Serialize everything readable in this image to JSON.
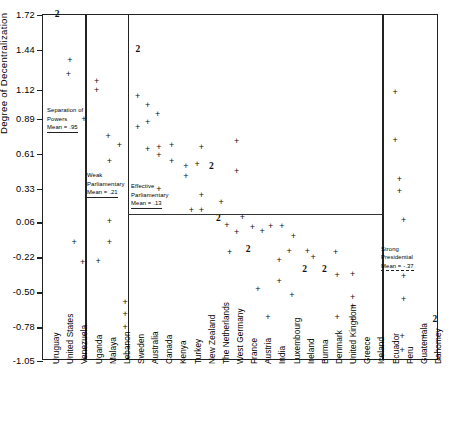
{
  "chart_data": {
    "type": "scatter",
    "title": "",
    "xlabel": "",
    "ylabel": "Degree of Decentralization",
    "ylim": [
      -1.05,
      1.72
    ],
    "grid": false,
    "legend": "none",
    "yticks": [
      "1.72",
      "1.44",
      "1.12",
      "0.89",
      "0.61",
      "0.33",
      "0.06",
      "-0.22",
      "-0.50",
      "-0.78",
      "-1.05"
    ],
    "ytick_values": [
      1.72,
      1.44,
      1.12,
      0.89,
      0.61,
      0.33,
      0.06,
      -0.22,
      -0.5,
      -0.78,
      -1.05
    ],
    "categories": [
      "Uruguay",
      "United States",
      "Venezuela",
      "Uganda",
      "Malaya",
      "Lebanon",
      "Sweden",
      "Australia",
      "Canada",
      "Kenya",
      "Turkey",
      "New Zealand",
      "The Netherlands",
      "West Germany",
      "France",
      "Austria",
      "India",
      "Luxembourg",
      "Ireland",
      "Burma",
      "Denmark",
      "United Kingdom",
      "Greece",
      "Iceland",
      "Ecuador",
      "Peru",
      "Guatemala",
      "Dahomey"
    ],
    "groups": [
      {
        "name": "Separation of Powers",
        "mean_label": "Mean = .95",
        "mean": 0.95,
        "categories": [
          "Uruguay",
          "United States",
          "Venezuela"
        ]
      },
      {
        "name": "Weak Parliamentary",
        "mean_label": "Mean = .21",
        "mean": 0.21,
        "categories": [
          "Uganda",
          "Malaya",
          "Lebanon"
        ]
      },
      {
        "name": "Effective Parliamentary",
        "mean_label": "Mean = .13",
        "mean": 0.13,
        "categories": [
          "Sweden",
          "Australia",
          "Canada",
          "Kenya",
          "Turkey",
          "New Zealand",
          "The Netherlands",
          "West Germany",
          "France",
          "Austria",
          "India",
          "Luxembourg",
          "Ireland",
          "Burma",
          "Denmark",
          "United Kingdom",
          "Greece",
          "Iceland"
        ]
      },
      {
        "name": "Strong Presidential",
        "mean_label": "Mean = -.37",
        "mean": -0.37,
        "categories": [
          "Ecuador",
          "Peru",
          "Guatemala",
          "Dahomey"
        ]
      }
    ],
    "points": [
      {
        "cx": 0.5,
        "y": 1.72,
        "marker": "2"
      },
      {
        "cx": 1.4,
        "y": 1.36,
        "marker": "+"
      },
      {
        "cx": 1.3,
        "y": 1.25,
        "marker": "+"
      },
      {
        "cx": 2.4,
        "y": 0.89,
        "marker": "+"
      },
      {
        "cx": 1.7,
        "y": -0.1,
        "marker": "+"
      },
      {
        "cx": 2.3,
        "y": -0.26,
        "marker": "+"
      },
      {
        "cx": 3.3,
        "y": 1.19,
        "marker": "+"
      },
      {
        "cx": 3.3,
        "y": 1.12,
        "marker": "+"
      },
      {
        "cx": 4.1,
        "y": 0.75,
        "marker": "+"
      },
      {
        "cx": 4.9,
        "y": 0.68,
        "marker": "+"
      },
      {
        "cx": 4.2,
        "y": 0.55,
        "marker": "+"
      },
      {
        "cx": 4.2,
        "y": 0.07,
        "marker": "+"
      },
      {
        "cx": 4.2,
        "y": -0.1,
        "marker": "+"
      },
      {
        "cx": 3.4,
        "y": -0.25,
        "marker": "+"
      },
      {
        "cx": 5.3,
        "y": -0.58,
        "marker": "+"
      },
      {
        "cx": 5.3,
        "y": -0.67,
        "marker": "+"
      },
      {
        "cx": 5.3,
        "y": -0.78,
        "marker": "+"
      },
      {
        "cx": 6.2,
        "y": 1.44,
        "marker": "2"
      },
      {
        "cx": 6.2,
        "y": 1.07,
        "marker": "+"
      },
      {
        "cx": 6.9,
        "y": 1.0,
        "marker": "+"
      },
      {
        "cx": 7.6,
        "y": 0.93,
        "marker": "+"
      },
      {
        "cx": 6.9,
        "y": 0.86,
        "marker": "+"
      },
      {
        "cx": 6.2,
        "y": 0.82,
        "marker": "+"
      },
      {
        "cx": 6.9,
        "y": 0.65,
        "marker": "+"
      },
      {
        "cx": 7.7,
        "y": 0.66,
        "marker": "+"
      },
      {
        "cx": 8.6,
        "y": 0.68,
        "marker": "+"
      },
      {
        "cx": 10.7,
        "y": 0.66,
        "marker": "+"
      },
      {
        "cx": 13.2,
        "y": 0.71,
        "marker": "+"
      },
      {
        "cx": 7.7,
        "y": 0.6,
        "marker": "+"
      },
      {
        "cx": 8.6,
        "y": 0.55,
        "marker": "+"
      },
      {
        "cx": 9.6,
        "y": 0.51,
        "marker": "+"
      },
      {
        "cx": 10.4,
        "y": 0.53,
        "marker": "+"
      },
      {
        "cx": 11.4,
        "y": 0.5,
        "marker": "2"
      },
      {
        "cx": 13.2,
        "y": 0.47,
        "marker": "+"
      },
      {
        "cx": 9.6,
        "y": 0.43,
        "marker": "+"
      },
      {
        "cx": 7.7,
        "y": 0.33,
        "marker": "+"
      },
      {
        "cx": 10.7,
        "y": 0.28,
        "marker": "+"
      },
      {
        "cx": 12.1,
        "y": 0.22,
        "marker": "+"
      },
      {
        "cx": 10.0,
        "y": 0.16,
        "marker": "+"
      },
      {
        "cx": 10.7,
        "y": 0.16,
        "marker": "+"
      },
      {
        "cx": 11.9,
        "y": 0.09,
        "marker": "2"
      },
      {
        "cx": 13.6,
        "y": 0.1,
        "marker": "+"
      },
      {
        "cx": 12.5,
        "y": 0.04,
        "marker": "+"
      },
      {
        "cx": 14.3,
        "y": 0.02,
        "marker": "+"
      },
      {
        "cx": 15.6,
        "y": 0.03,
        "marker": "+"
      },
      {
        "cx": 16.4,
        "y": 0.03,
        "marker": "+"
      },
      {
        "cx": 13.2,
        "y": -0.02,
        "marker": "+"
      },
      {
        "cx": 15.0,
        "y": -0.01,
        "marker": "+"
      },
      {
        "cx": 17.2,
        "y": -0.05,
        "marker": "+"
      },
      {
        "cx": 14.0,
        "y": -0.16,
        "marker": "2"
      },
      {
        "cx": 12.7,
        "y": -0.18,
        "marker": "+"
      },
      {
        "cx": 16.9,
        "y": -0.17,
        "marker": "+"
      },
      {
        "cx": 18.2,
        "y": -0.17,
        "marker": "+"
      },
      {
        "cx": 18.6,
        "y": -0.22,
        "marker": "+"
      },
      {
        "cx": 20.2,
        "y": -0.18,
        "marker": "+"
      },
      {
        "cx": 16.2,
        "y": -0.24,
        "marker": "+"
      },
      {
        "cx": 18.0,
        "y": -0.32,
        "marker": "2"
      },
      {
        "cx": 19.4,
        "y": -0.32,
        "marker": "2"
      },
      {
        "cx": 20.3,
        "y": -0.36,
        "marker": "+"
      },
      {
        "cx": 21.4,
        "y": -0.35,
        "marker": "+"
      },
      {
        "cx": 16.2,
        "y": -0.41,
        "marker": "+"
      },
      {
        "cx": 14.7,
        "y": -0.47,
        "marker": "+"
      },
      {
        "cx": 17.1,
        "y": -0.52,
        "marker": "+"
      },
      {
        "cx": 21.4,
        "y": -0.54,
        "marker": "+"
      },
      {
        "cx": 21.4,
        "y": -0.61,
        "marker": "+"
      },
      {
        "cx": 15.4,
        "y": -0.7,
        "marker": "+"
      },
      {
        "cx": 20.3,
        "y": -0.7,
        "marker": "+"
      },
      {
        "cx": 21.4,
        "y": -0.72,
        "marker": "+"
      },
      {
        "cx": 24.4,
        "y": 1.1,
        "marker": "+"
      },
      {
        "cx": 24.4,
        "y": 0.72,
        "marker": "+"
      },
      {
        "cx": 24.7,
        "y": 0.41,
        "marker": "+"
      },
      {
        "cx": 24.7,
        "y": 0.31,
        "marker": "+"
      },
      {
        "cx": 25.0,
        "y": 0.08,
        "marker": "+"
      },
      {
        "cx": 25.0,
        "y": -0.37,
        "marker": "+"
      },
      {
        "cx": 25.0,
        "y": -0.55,
        "marker": "+"
      },
      {
        "cx": 27.2,
        "y": -0.72,
        "marker": "2"
      },
      {
        "cx": 24.9,
        "y": -0.85,
        "marker": "+"
      },
      {
        "cx": 26.4,
        "y": -0.85,
        "marker": "+"
      },
      {
        "cx": 24.9,
        "y": -0.96,
        "marker": "+"
      },
      {
        "cx": 27.5,
        "y": -1.03,
        "marker": "+"
      }
    ]
  }
}
